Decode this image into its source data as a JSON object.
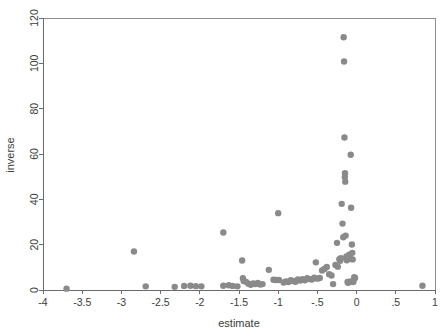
{
  "chart_data": {
    "type": "scatter",
    "title": "",
    "xlabel": "estimate",
    "ylabel": "inverse",
    "xlim": [
      -4,
      1
    ],
    "ylim": [
      0,
      120
    ],
    "grid": false,
    "legend": null,
    "marker": {
      "color": "#8a8a8a",
      "shape": "circle",
      "radius_px": 3.2
    },
    "xticks": [
      -4,
      -3.5,
      -3,
      -2.5,
      -2,
      -1.5,
      -1,
      -0.5,
      0,
      0.5,
      1
    ],
    "xtick_labels": [
      "-4",
      "-3.5",
      "-3",
      "-2.5",
      "-2",
      "-1.5",
      "-1",
      "-.5",
      "0",
      ".5",
      "1"
    ],
    "yticks": [
      0,
      20,
      40,
      60,
      80,
      100,
      120
    ],
    "ytick_labels": [
      "0",
      "20",
      "40",
      "60",
      "80",
      "100",
      "120"
    ],
    "points": [
      [
        -3.7,
        0.6
      ],
      [
        -2.84,
        17.0
      ],
      [
        -2.69,
        1.6
      ],
      [
        -2.32,
        1.4
      ],
      [
        -2.2,
        1.8
      ],
      [
        -2.12,
        1.9
      ],
      [
        -2.05,
        1.7
      ],
      [
        -1.98,
        1.6
      ],
      [
        -1.7,
        25.4
      ],
      [
        -1.7,
        1.9
      ],
      [
        -1.63,
        2.1
      ],
      [
        -1.58,
        1.8
      ],
      [
        -1.52,
        1.6
      ],
      [
        -1.46,
        13.0
      ],
      [
        -1.45,
        5.2
      ],
      [
        -1.44,
        4.0
      ],
      [
        -1.41,
        3.6
      ],
      [
        -1.38,
        2.8
      ],
      [
        -1.35,
        2.3
      ],
      [
        -1.32,
        2.9
      ],
      [
        -1.29,
        2.6
      ],
      [
        -1.26,
        3.1
      ],
      [
        -1.23,
        2.4
      ],
      [
        -1.2,
        2.6
      ],
      [
        -1.12,
        8.9
      ],
      [
        -1.06,
        4.5
      ],
      [
        -1.03,
        4.4
      ],
      [
        -1.0,
        33.9
      ],
      [
        -0.99,
        4.4
      ],
      [
        -0.93,
        3.3
      ],
      [
        -0.9,
        3.8
      ],
      [
        -0.87,
        3.5
      ],
      [
        -0.84,
        4.3
      ],
      [
        -0.81,
        4.0
      ],
      [
        -0.78,
        3.6
      ],
      [
        -0.75,
        4.6
      ],
      [
        -0.72,
        4.2
      ],
      [
        -0.69,
        4.8
      ],
      [
        -0.66,
        4.3
      ],
      [
        -0.63,
        5.2
      ],
      [
        -0.6,
        4.8
      ],
      [
        -0.57,
        4.6
      ],
      [
        -0.54,
        5.4
      ],
      [
        -0.52,
        12.2
      ],
      [
        -0.5,
        5.0
      ],
      [
        -0.47,
        5.3
      ],
      [
        -0.44,
        8.6
      ],
      [
        -0.41,
        9.3
      ],
      [
        -0.38,
        10.2
      ],
      [
        -0.35,
        7.0
      ],
      [
        -0.32,
        6.4
      ],
      [
        -0.3,
        2.6
      ],
      [
        -0.27,
        11.0
      ],
      [
        -0.25,
        20.8
      ],
      [
        -0.24,
        10.3
      ],
      [
        -0.22,
        13.6
      ],
      [
        -0.21,
        12.9
      ],
      [
        -0.2,
        14.0
      ],
      [
        -0.19,
        38.0
      ],
      [
        -0.18,
        29.3
      ],
      [
        -0.17,
        23.3
      ],
      [
        -0.165,
        111.5
      ],
      [
        -0.16,
        100.8
      ],
      [
        -0.155,
        67.3
      ],
      [
        -0.15,
        49.8
      ],
      [
        -0.148,
        51.5
      ],
      [
        -0.145,
        47.8
      ],
      [
        -0.14,
        24.0
      ],
      [
        -0.13,
        14.8
      ],
      [
        -0.125,
        13.1
      ],
      [
        -0.12,
        13.7
      ],
      [
        -0.115,
        3.6
      ],
      [
        -0.11,
        3.2
      ],
      [
        -0.1,
        3.4
      ],
      [
        -0.095,
        15.6
      ],
      [
        -0.09,
        14.4
      ],
      [
        -0.085,
        13.8
      ],
      [
        -0.08,
        3.8
      ],
      [
        -0.075,
        59.7
      ],
      [
        -0.07,
        36.3
      ],
      [
        -0.06,
        20.1
      ],
      [
        -0.055,
        16.4
      ],
      [
        -0.05,
        13.5
      ],
      [
        -0.045,
        3.5
      ],
      [
        -0.04,
        3.7
      ],
      [
        -0.03,
        5.6
      ],
      [
        -0.02,
        5.3
      ],
      [
        0.84,
        1.9
      ]
    ]
  }
}
